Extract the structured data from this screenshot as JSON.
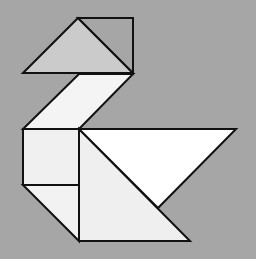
{
  "figure": {
    "background": "#a6a6a6",
    "stroke": "#111111",
    "stroke_width": 2
  },
  "pieces": [
    {
      "id": "head-triangle",
      "fill": "#cbcbcb",
      "points": "23,73 78,18 133,73"
    },
    {
      "id": "beak-triangle",
      "fill": "#a6a6a6",
      "points": "78,18 133,18 133,73"
    },
    {
      "id": "neck-parallelogram",
      "fill": "#f4f4f4",
      "points": "79,74 133,74 79,129 23,129"
    },
    {
      "id": "body-square",
      "fill": "#f0f0f0",
      "points": "23,129 79,129 79,185 23,185"
    },
    {
      "id": "small-tail-triangle",
      "fill": "#f2f2f2",
      "points": "23,185 79,185 79,241"
    },
    {
      "id": "large-body-triangle",
      "fill": "#efefef",
      "points": "79,129 79,241 190,241"
    },
    {
      "id": "wing-triangle",
      "fill": "#ffffff",
      "points": "79,129 236,129 158,208"
    }
  ]
}
